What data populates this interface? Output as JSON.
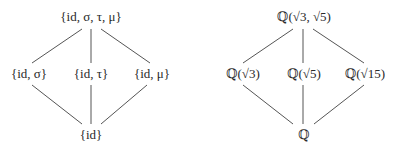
{
  "left_diagram": {
    "title": "Galois group subgroup lattice",
    "top": "{id, σ, τ, μ}",
    "middle": [
      "{id, σ}",
      "{id, τ}",
      "{id, μ}"
    ],
    "bottom": "{id}"
  },
  "right_diagram": {
    "title": "Intermediate field lattice",
    "top": "ℚ(√3, √5)",
    "middle": [
      "ℚ(√3)",
      "ℚ(√5)",
      "ℚ(√15)"
    ],
    "bottom": "ℚ"
  },
  "colors": {
    "edge": "#555555",
    "text": "#2a2a2a",
    "background": "#ffffff"
  }
}
